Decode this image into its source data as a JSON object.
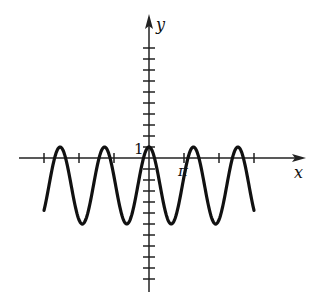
{
  "chart_data": {
    "type": "line",
    "title": "",
    "xlabel": "x",
    "ylabel": "y",
    "x_tick_labels": [
      {
        "value": "π",
        "position_ticks": 1
      }
    ],
    "y_tick_labels": [
      {
        "value": "1",
        "position_ticks": 1
      }
    ],
    "x_ticks_in_pi": [
      -3,
      -2,
      -1,
      1,
      2,
      3
    ],
    "y_ticks": [
      -12,
      -11,
      -10,
      -9,
      -8,
      -7,
      -6,
      -5,
      -4,
      -3,
      -2,
      -1,
      1,
      2,
      3,
      4,
      5,
      6,
      7,
      8,
      9,
      10
    ],
    "xlim_pi": [
      -3.7,
      4.5
    ],
    "ylim": [
      -12,
      14
    ],
    "grid": false,
    "legend": null,
    "series": [
      {
        "name": "curve",
        "description": "cosine-like wave, maximum 1 at x=0, minimum about -6, period about 4π/3",
        "domain_pi": [
          -3,
          3
        ],
        "amplitude": 3.5,
        "midline": -2.5,
        "period_pi": 1.27,
        "points": [
          {
            "x_pi": -3.0,
            "y": -4.3
          },
          {
            "x_pi": -2.54,
            "y": 1
          },
          {
            "x_pi": -1.91,
            "y": -6
          },
          {
            "x_pi": -1.27,
            "y": 1
          },
          {
            "x_pi": -0.64,
            "y": -6
          },
          {
            "x_pi": 0,
            "y": 1
          },
          {
            "x_pi": 0.64,
            "y": -6
          },
          {
            "x_pi": 1.27,
            "y": 1
          },
          {
            "x_pi": 1.91,
            "y": -6
          },
          {
            "x_pi": 2.54,
            "y": 1
          },
          {
            "x_pi": 3.0,
            "y": -4.3
          }
        ]
      }
    ]
  },
  "labels": {
    "x_axis": "x",
    "y_axis": "y",
    "y_one": "1",
    "x_pi": "π"
  }
}
